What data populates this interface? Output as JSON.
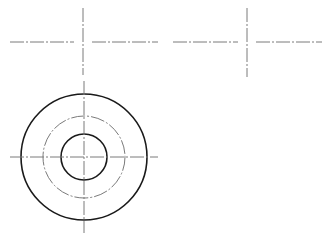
{
  "caption": {
    "text": ""
  },
  "style": {
    "background": "#ffffff",
    "solid_line_color": "#1a1a1a",
    "center_line_color": "#7a7a7a",
    "center_line_dash": "14 2 2 2"
  },
  "views": {
    "top_left_cross": {
      "center": [
        83,
        42
      ],
      "horizontal_segments": [
        [
          10,
          74
        ],
        [
          92,
          158
        ]
      ],
      "vertical_segment": [
        8,
        75
      ]
    },
    "top_right_cross": {
      "center": [
        247,
        42
      ],
      "horizontal_segments": [
        [
          173,
          238
        ],
        [
          256,
          322
        ]
      ],
      "vertical_segment": [
        8,
        77
      ]
    },
    "circle_view": {
      "center": [
        84,
        157
      ],
      "outer_circle_radius": 63,
      "pitch_circle_radius": 41,
      "inner_circle_radius": 23,
      "horizontal_center_line": [
        10,
        158
      ],
      "vertical_center_line": [
        81,
        233
      ]
    }
  }
}
